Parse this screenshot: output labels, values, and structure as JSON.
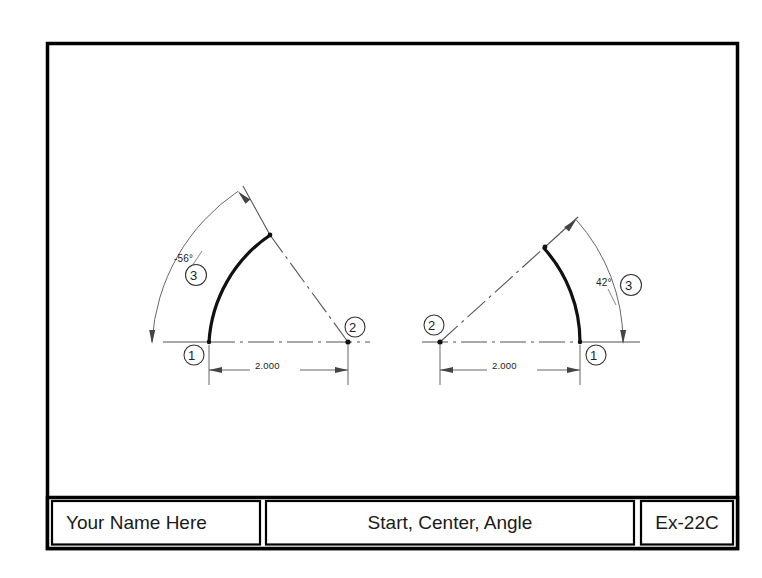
{
  "sheet": {
    "width": 762,
    "height": 578,
    "border_color": "#000000",
    "background": "#ffffff"
  },
  "title_block": {
    "name_label": "Your Name Here",
    "drawing_title": "Start, Center, Angle",
    "exercise_number": "Ex-22C"
  },
  "drawing": {
    "type": "cad-arc-exercise",
    "figures": [
      {
        "id": "left-figure",
        "name": "negative-angle-arc",
        "start_point_bubble": "1",
        "center_point_bubble": "2",
        "angle_bubble": "3",
        "angle_label": "-56°",
        "radius_label": "2.000",
        "start_point": {
          "x": 209,
          "y": 342
        },
        "center_point": {
          "x": 348,
          "y": 342
        },
        "arc_end_point": {
          "x": 270,
          "y": 235
        },
        "radius_px": 139,
        "start_angle_deg": 180,
        "sweep_deg": -56
      },
      {
        "id": "right-figure",
        "name": "positive-angle-arc",
        "start_point_bubble": "1",
        "center_point_bubble": "2",
        "angle_bubble": "3",
        "angle_label": "42°",
        "radius_label": "2.000",
        "start_point": {
          "x": 580,
          "y": 342
        },
        "center_point": {
          "x": 440,
          "y": 342
        },
        "arc_end_point": {
          "x": 545,
          "y": 247
        },
        "radius_px": 140,
        "start_angle_deg": 0,
        "sweep_deg": 42
      }
    ],
    "line_styles": {
      "object_line": "thick-solid",
      "center_line": "dash-dot",
      "dimension_line": "thin-solid",
      "extension_line": "thin-solid"
    },
    "colors": {
      "object": "#111111",
      "thin": "#555555",
      "center": "#666666",
      "text": "#222222"
    }
  }
}
